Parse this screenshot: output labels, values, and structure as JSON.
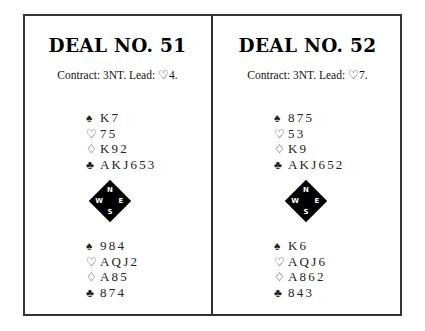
{
  "deals": [
    {
      "title": "DEAL NO. 51",
      "contract": "Contract: 3NT. Lead: ♡4.",
      "north": {
        "spades": "K7",
        "hearts": "75",
        "diamonds": "K92",
        "clubs": "AKJ653"
      },
      "south": {
        "spades": "984",
        "hearts": "AQJ2",
        "diamonds": "A85",
        "clubs": "874"
      },
      "compass": {
        "n": "N",
        "s": "S",
        "w": "W",
        "e": "E"
      }
    },
    {
      "title": "DEAL NO. 52",
      "contract": "Contract: 3NT. Lead: ♡7.",
      "north": {
        "spades": "875",
        "hearts": "53",
        "diamonds": "K9",
        "clubs": "AKJ652"
      },
      "south": {
        "spades": "K6",
        "hearts": "AQJ6",
        "diamonds": "A862",
        "clubs": "843"
      },
      "compass": {
        "n": "N",
        "s": "S",
        "w": "W",
        "e": "E"
      }
    }
  ],
  "suits": {
    "spades": "♠",
    "hearts": "♡",
    "diamonds": "♢",
    "clubs": "♣"
  }
}
